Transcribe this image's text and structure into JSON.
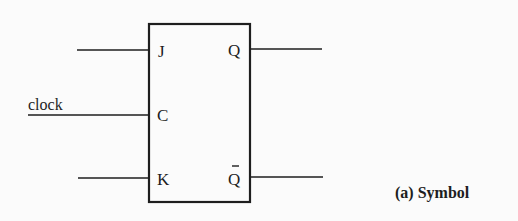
{
  "diagram": {
    "type": "JK flip-flop symbol",
    "inputs": [
      {
        "pin": "J",
        "signal": ""
      },
      {
        "pin": "C",
        "signal": "clock"
      },
      {
        "pin": "K",
        "signal": ""
      }
    ],
    "outputs": [
      {
        "pin": "Q"
      },
      {
        "pin": "Q̄"
      }
    ],
    "labels": {
      "j": "J",
      "c": "C",
      "k": "K",
      "q": "Q",
      "q_bar": "Q",
      "clock": "clock",
      "caption": "(a) Symbol"
    },
    "colors": {
      "ink": "#1e1e1e",
      "background": "#fbfbfb"
    }
  }
}
